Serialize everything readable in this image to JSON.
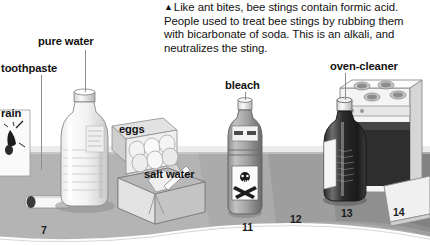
{
  "figure": {
    "caption": {
      "marker": "▲",
      "text": "Like ant bites, bee stings contain formic acid. People used to treat bee stings by rubbing them with bicarbonate of soda. This is an alkali, and neutralizes the sting."
    },
    "labels": [
      {
        "id": "rain",
        "text": "rain"
      },
      {
        "id": "toothpaste",
        "text": "toothpaste"
      },
      {
        "id": "pure-water",
        "text": "pure water"
      },
      {
        "id": "eggs",
        "text": "eggs"
      },
      {
        "id": "salt-water",
        "text": "salt water"
      },
      {
        "id": "bleach",
        "text": "bleach"
      },
      {
        "id": "oven-cleaner",
        "text": "oven-cleaner"
      }
    ],
    "scale": {
      "name": "pH scale",
      "ticks": [
        "7",
        "11",
        "12",
        "13",
        "14"
      ]
    },
    "objects": [
      {
        "id": "toothpaste-tube",
        "name": "toothpaste tube"
      },
      {
        "id": "rain-box",
        "name": "rain box"
      },
      {
        "id": "water-bottle",
        "name": "pure water bottle"
      },
      {
        "id": "egg-carton",
        "name": "egg carton with eggs"
      },
      {
        "id": "salt-block",
        "name": "salt water block"
      },
      {
        "id": "bleach-bottle",
        "name": "bleach bottle with poison label"
      },
      {
        "id": "oven-cleaner-bottle",
        "name": "oven cleaner bottle"
      },
      {
        "id": "oven",
        "name": "oven"
      }
    ],
    "colors": {
      "ground_light": "#b4b4b4",
      "ground_mid": "#a0a0a0",
      "ground_dark": "#8c8c8c",
      "ground_darker": "#7b7b7b",
      "text": "#111111",
      "leader": "#8f8f8f"
    }
  }
}
